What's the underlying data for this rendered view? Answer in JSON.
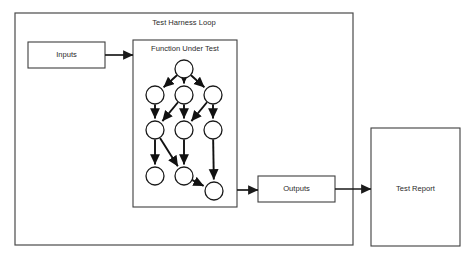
{
  "diagram": {
    "title": "Test Harness Loop",
    "colors": {
      "background": "#ffffff",
      "box_stroke": "#3f3f3f",
      "outer_stroke": "#4a4a4a",
      "node_stroke": "#1a1a1a",
      "edge": "#111111",
      "text": "#2b2b2b"
    },
    "outer_container": {
      "label": "Test Harness Loop",
      "x": 15,
      "y": 13,
      "width": 338,
      "height": 232
    },
    "boxes": [
      {
        "id": "inputs",
        "label": "Inputs",
        "x": 28,
        "y": 42,
        "width": 77,
        "height": 26
      },
      {
        "id": "function-under-test",
        "label": "Function Under Test",
        "x": 133,
        "y": 40,
        "width": 104,
        "height": 167
      },
      {
        "id": "outputs",
        "label": "Outputs",
        "x": 258,
        "y": 176,
        "width": 77,
        "height": 26
      },
      {
        "id": "test-report",
        "label": "Test Report",
        "x": 371,
        "y": 128,
        "width": 89,
        "height": 118
      }
    ],
    "graph": {
      "node_radius": 9,
      "nodes": [
        {
          "id": "n0",
          "cx": 184,
          "cy": 69
        },
        {
          "id": "n1",
          "cx": 155,
          "cy": 95
        },
        {
          "id": "n2",
          "cx": 184,
          "cy": 95
        },
        {
          "id": "n3",
          "cx": 213,
          "cy": 95
        },
        {
          "id": "n4",
          "cx": 155,
          "cy": 130
        },
        {
          "id": "n5",
          "cx": 184,
          "cy": 130
        },
        {
          "id": "n6",
          "cx": 213,
          "cy": 130
        },
        {
          "id": "n7",
          "cx": 155,
          "cy": 176
        },
        {
          "id": "n8",
          "cx": 184,
          "cy": 176
        },
        {
          "id": "n9",
          "cx": 214,
          "cy": 191
        }
      ],
      "edges": [
        {
          "from": "n0",
          "to": "n1"
        },
        {
          "from": "n0",
          "to": "n2"
        },
        {
          "from": "n0",
          "to": "n3"
        },
        {
          "from": "n1",
          "to": "n4"
        },
        {
          "from": "n2",
          "to": "n4"
        },
        {
          "from": "n2",
          "to": "n5"
        },
        {
          "from": "n3",
          "to": "n5"
        },
        {
          "from": "n3",
          "to": "n6"
        },
        {
          "from": "n4",
          "to": "n7"
        },
        {
          "from": "n4",
          "to": "n8"
        },
        {
          "from": "n5",
          "to": "n8"
        },
        {
          "from": "n6",
          "to": "n9"
        },
        {
          "from": "n8",
          "to": "n9"
        }
      ]
    },
    "flows": [
      {
        "id": "inputs-to-function",
        "from": "inputs",
        "to": "function-under-test",
        "x1": 105,
        "y1": 55,
        "x2": 133,
        "y2": 55
      },
      {
        "id": "function-to-outputs",
        "from": "function-under-test",
        "to": "outputs",
        "x1": 237,
        "y1": 190,
        "x2": 258,
        "y2": 190
      },
      {
        "id": "outputs-to-test-report",
        "from": "outputs",
        "to": "test-report",
        "x1": 335,
        "y1": 189,
        "x2": 371,
        "y2": 189
      }
    ]
  }
}
